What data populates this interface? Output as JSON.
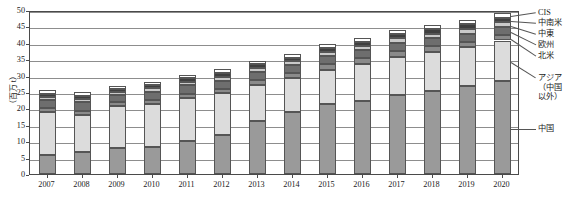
{
  "axis": {
    "y_title": "（百万 t）",
    "y_ticks": [
      "0",
      "5",
      "10",
      "15",
      "20",
      "25",
      "30",
      "35",
      "40",
      "45",
      "50"
    ],
    "x_ticks": [
      "2007",
      "2008",
      "2009",
      "2010",
      "2011",
      "2012",
      "2013",
      "2014",
      "2015",
      "2016",
      "2017",
      "2018",
      "2019",
      "2020"
    ]
  },
  "legend": {
    "items": [
      {
        "label": "CIS",
        "color": "#ffffff"
      },
      {
        "label": "中南米",
        "color": "#3f3f3f"
      },
      {
        "label": "中東",
        "color": "#c9c9c9"
      },
      {
        "label": "欧州",
        "color": "#6e6e6e"
      },
      {
        "label": "北米",
        "color": "#8a8a8a"
      },
      {
        "label": "アジア",
        "label2": "（中国",
        "label3": "以外）",
        "color": "#dcdcdc"
      },
      {
        "label": "中国",
        "color": "#9a9a9a"
      }
    ]
  },
  "chart_data": {
    "type": "bar",
    "stacked": true,
    "title": "",
    "xlabel": "",
    "ylabel": "（百万 t）",
    "ylim": [
      0,
      50
    ],
    "ytick_step": 5,
    "grid": true,
    "legend_position": "right",
    "categories": [
      "2007",
      "2008",
      "2009",
      "2010",
      "2011",
      "2012",
      "2013",
      "2014",
      "2015",
      "2016",
      "2017",
      "2018",
      "2019",
      "2020"
    ],
    "series": [
      {
        "name": "中国",
        "color": "#9a9a9a",
        "values": [
          5.8,
          6.7,
          7.8,
          8.2,
          10.2,
          11.9,
          16.2,
          18.8,
          21.2,
          22.4,
          24.2,
          25.3,
          26.8,
          28.3
        ]
      },
      {
        "name": "アジア（中国以外）",
        "color": "#dcdcdc",
        "values": [
          13.0,
          11.4,
          13.0,
          13.2,
          12.9,
          12.7,
          11.0,
          10.4,
          10.6,
          11.2,
          11.6,
          12.0,
          11.8,
          12.4
        ]
      },
      {
        "name": "北米",
        "color": "#8a8a8a",
        "values": [
          1.2,
          1.2,
          1.1,
          1.3,
          1.4,
          1.4,
          1.4,
          1.5,
          1.6,
          1.7,
          1.7,
          1.7,
          1.7,
          1.6
        ]
      },
      {
        "name": "欧州",
        "color": "#6e6e6e",
        "values": [
          2.6,
          2.6,
          2.3,
          2.4,
          2.5,
          2.5,
          2.4,
          2.4,
          2.5,
          2.4,
          2.5,
          2.4,
          2.4,
          2.5
        ]
      },
      {
        "name": "中東",
        "color": "#c9c9c9",
        "values": [
          0.9,
          0.9,
          0.9,
          1.0,
          1.1,
          1.2,
          1.2,
          1.2,
          1.3,
          1.3,
          1.4,
          1.4,
          1.5,
          1.5
        ]
      },
      {
        "name": "中南米",
        "color": "#3f3f3f",
        "values": [
          1.0,
          1.0,
          0.9,
          1.1,
          1.1,
          1.2,
          1.2,
          1.2,
          1.3,
          1.3,
          1.3,
          1.3,
          1.4,
          1.4
        ]
      },
      {
        "name": "CIS",
        "color": "#ffffff",
        "values": [
          1.1,
          1.1,
          0.8,
          1.0,
          1.1,
          1.1,
          1.1,
          1.1,
          1.2,
          1.2,
          1.2,
          1.2,
          1.3,
          1.3
        ]
      }
    ],
    "totals": [
      25.6,
      24.9,
      26.8,
      28.2,
      30.3,
      32.0,
      34.5,
      36.6,
      39.7,
      41.5,
      43.9,
      45.3,
      46.9,
      49.0
    ]
  }
}
